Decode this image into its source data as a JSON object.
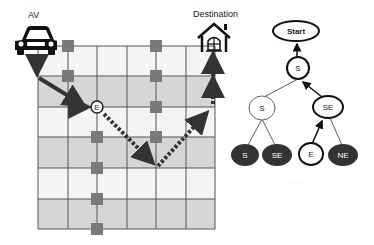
{
  "grid": {
    "labels": {
      "start": "AV",
      "goal": "Destination"
    },
    "columns": 6,
    "rows": 6,
    "x_lines": [
      38,
      68,
      97,
      127,
      156,
      186,
      215
    ],
    "y_lines": [
      46,
      76,
      107,
      137,
      168,
      199,
      229
    ],
    "row_shading": [
      "light",
      "gray",
      "light",
      "gray",
      "light",
      "gray"
    ],
    "colors": {
      "light": "#f4f4f4",
      "gray": "#d6d6d6",
      "line": "#555555",
      "obstacle": "#7a7a7a",
      "path": "#444444",
      "dark_node": "#333333"
    },
    "obstacles": [
      {
        "x": 68,
        "y": 46
      },
      {
        "x": 68,
        "y": 76
      },
      {
        "x": 156,
        "y": 46
      },
      {
        "x": 156,
        "y": 76
      },
      {
        "x": 156,
        "y": 107
      },
      {
        "x": 156,
        "y": 137
      },
      {
        "x": 97,
        "y": 137
      },
      {
        "x": 97,
        "y": 168
      },
      {
        "x": 97,
        "y": 199
      },
      {
        "x": 97,
        "y": 229
      }
    ],
    "waypoint_label": "E"
  },
  "tree": {
    "root": "Start",
    "level1": [
      "S"
    ],
    "level2": [
      "S",
      "SE"
    ],
    "level3": [
      "S",
      "SE",
      "E",
      "NE"
    ],
    "ellipsis": "· · ·"
  }
}
